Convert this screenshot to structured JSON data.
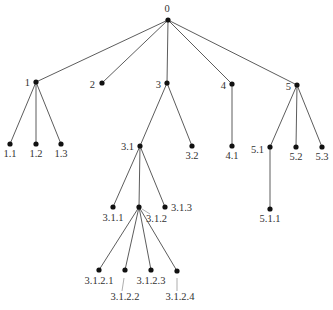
{
  "diagram": {
    "type": "rooted-tree",
    "root": "0",
    "nodes": [
      {
        "id": "0",
        "x": 168,
        "y": 20,
        "lx": 167,
        "ly": 12,
        "anchor": "middle"
      },
      {
        "id": "1",
        "x": 36,
        "y": 82,
        "lx": 30,
        "ly": 86,
        "anchor": "end"
      },
      {
        "id": "2",
        "x": 102,
        "y": 83,
        "lx": 95,
        "ly": 88,
        "anchor": "end"
      },
      {
        "id": "3",
        "x": 167,
        "y": 83,
        "lx": 161,
        "ly": 88,
        "anchor": "end"
      },
      {
        "id": "4",
        "x": 232,
        "y": 84,
        "lx": 226,
        "ly": 89,
        "anchor": "end"
      },
      {
        "id": "5",
        "x": 297,
        "y": 85,
        "lx": 291,
        "ly": 90,
        "anchor": "end"
      },
      {
        "id": "1.1",
        "x": 10,
        "y": 144,
        "lx": 10,
        "ly": 157,
        "anchor": "middle"
      },
      {
        "id": "1.2",
        "x": 36,
        "y": 144,
        "lx": 36,
        "ly": 157,
        "anchor": "middle"
      },
      {
        "id": "1.3",
        "x": 61,
        "y": 144,
        "lx": 61,
        "ly": 157,
        "anchor": "middle"
      },
      {
        "id": "3.1",
        "x": 140,
        "y": 146,
        "lx": 134,
        "ly": 150,
        "anchor": "end"
      },
      {
        "id": "3.2",
        "x": 192,
        "y": 146,
        "lx": 192,
        "ly": 159,
        "anchor": "middle"
      },
      {
        "id": "4.1",
        "x": 232,
        "y": 146,
        "lx": 232,
        "ly": 159,
        "anchor": "middle"
      },
      {
        "id": "5.1",
        "x": 270,
        "y": 147,
        "lx": 264,
        "ly": 153,
        "anchor": "end"
      },
      {
        "id": "5.2",
        "x": 296,
        "y": 147,
        "lx": 296,
        "ly": 160,
        "anchor": "middle"
      },
      {
        "id": "5.3",
        "x": 322,
        "y": 147,
        "lx": 322,
        "ly": 160,
        "anchor": "middle"
      },
      {
        "id": "3.1.1",
        "x": 113,
        "y": 207,
        "lx": 113,
        "ly": 221,
        "anchor": "middle"
      },
      {
        "id": "3.1.2",
        "x": 139,
        "y": 207,
        "lx": 146,
        "ly": 222,
        "anchor": "start"
      },
      {
        "id": "3.1.3",
        "x": 165,
        "y": 207,
        "lx": 171,
        "ly": 211,
        "anchor": "start"
      },
      {
        "id": "5.1.1",
        "x": 270,
        "y": 209,
        "lx": 270,
        "ly": 222,
        "anchor": "middle"
      },
      {
        "id": "3.1.2.1",
        "x": 99,
        "y": 270,
        "lx": 99,
        "ly": 284,
        "anchor": "middle"
      },
      {
        "id": "3.1.2.2",
        "x": 125,
        "y": 270,
        "lx": 125,
        "ly": 300,
        "anchor": "middle"
      },
      {
        "id": "3.1.2.3",
        "x": 151,
        "y": 270,
        "lx": 151,
        "ly": 284,
        "anchor": "middle"
      },
      {
        "id": "3.1.2.4",
        "x": 177,
        "y": 271,
        "lx": 180,
        "ly": 300,
        "anchor": "middle"
      }
    ],
    "edges": [
      [
        "0",
        "1"
      ],
      [
        "0",
        "2"
      ],
      [
        "0",
        "3"
      ],
      [
        "0",
        "4"
      ],
      [
        "0",
        "5"
      ],
      [
        "1",
        "1.1"
      ],
      [
        "1",
        "1.2"
      ],
      [
        "1",
        "1.3"
      ],
      [
        "3",
        "3.1"
      ],
      [
        "3",
        "3.2"
      ],
      [
        "4",
        "4.1"
      ],
      [
        "5",
        "5.1"
      ],
      [
        "5",
        "5.2"
      ],
      [
        "5",
        "5.3"
      ],
      [
        "3.1",
        "3.1.1"
      ],
      [
        "3.1",
        "3.1.2"
      ],
      [
        "3.1",
        "3.1.3"
      ],
      [
        "5.1",
        "5.1.1"
      ],
      [
        "3.1.2",
        "3.1.2.1"
      ],
      [
        "3.1.2",
        "3.1.2.2"
      ],
      [
        "3.1.2",
        "3.1.2.3"
      ],
      [
        "3.1.2",
        "3.1.2.4"
      ]
    ],
    "leaders": [
      {
        "for": "3.1.2",
        "x1": 142,
        "y1": 209,
        "x2": 150,
        "y2": 214
      },
      {
        "for": "3.1.2.2",
        "x1": 124,
        "y1": 278,
        "x2": 122,
        "y2": 291
      },
      {
        "for": "3.1.2.4",
        "x1": 177,
        "y1": 278,
        "x2": 177,
        "y2": 291
      }
    ],
    "colors": {
      "edge": "#4a4a4a",
      "node": "#111111",
      "label": "#333333"
    }
  }
}
